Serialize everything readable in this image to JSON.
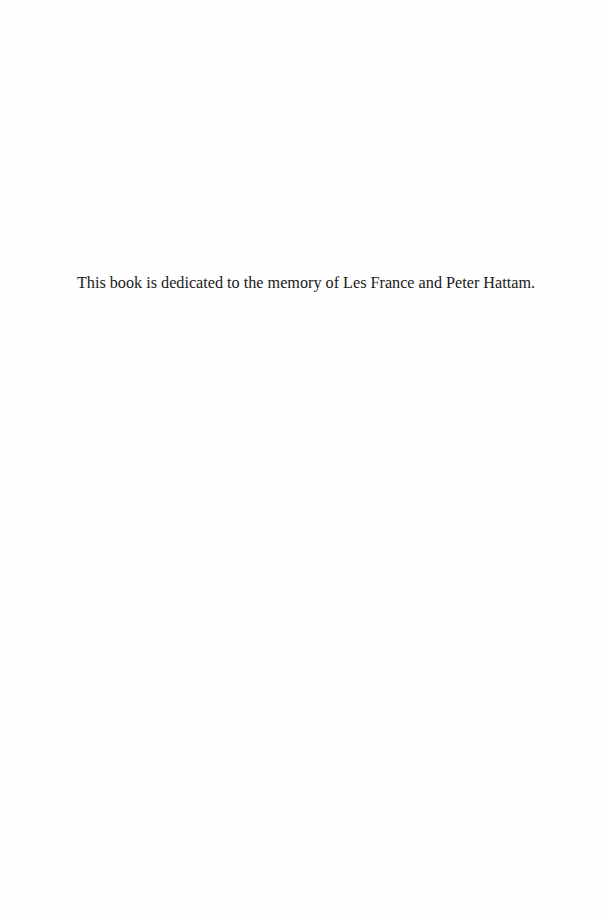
{
  "page": {
    "background": "#fefefe",
    "dedication": "This book is dedicated to the memory of Les France and Peter Hattam."
  }
}
